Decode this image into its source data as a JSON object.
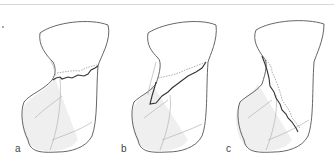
{
  "figure": {
    "colors": {
      "outline": "#555555",
      "fracture_solid": "#333333",
      "fracture_dotted": "#888888",
      "shade": "#ececec",
      "inner_line": "#b5b5b5",
      "top_rule": "#d8d8d8"
    },
    "panels": [
      {
        "id": "a",
        "label": "a",
        "fracture": "transverse"
      },
      {
        "id": "b",
        "label": "b",
        "fracture": "oblique"
      },
      {
        "id": "c",
        "label": "c",
        "fracture": "longitudinal"
      }
    ]
  }
}
